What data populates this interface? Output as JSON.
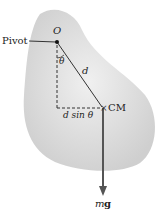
{
  "diagram": {
    "labels": {
      "pivot": "Pivot",
      "origin": "O",
      "theta": "θ",
      "distance": "d",
      "cm": "CM",
      "lever_arm": "d sin θ",
      "weight_m": "m",
      "weight_g": "g"
    },
    "colors": {
      "body": "#dcdcdc",
      "arrow": "#555555",
      "line": "#333333"
    }
  }
}
